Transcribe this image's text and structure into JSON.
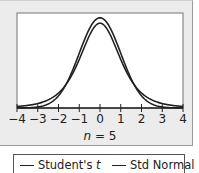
{
  "chart_data": {
    "type": "line",
    "title": "",
    "xlabel": "n = 5",
    "xlabel_parts": {
      "var": "n",
      "rest": " = 5"
    },
    "ylabel": "",
    "xlim": [
      -4,
      4
    ],
    "ylim": [
      0,
      0.42
    ],
    "x_ticks": [
      -4,
      -3,
      -2,
      -1,
      0,
      1,
      2,
      3,
      4
    ],
    "x_tick_labels": [
      "−4",
      "−3",
      "−2",
      "−1",
      "0",
      "1",
      "2",
      "3",
      "4"
    ],
    "grid": false,
    "legend_position": "bottom",
    "series": [
      {
        "name": "Student's t",
        "distribution": "student-t",
        "df": 4,
        "peak": 0.375
      },
      {
        "name": "Std Normal",
        "distribution": "normal",
        "mean": 0,
        "sd": 1,
        "peak": 0.399
      }
    ]
  },
  "legend": {
    "items": [
      {
        "label_main": "Student's ",
        "label_var": "t"
      },
      {
        "label_main": "Std Normal",
        "label_var": ""
      }
    ]
  }
}
